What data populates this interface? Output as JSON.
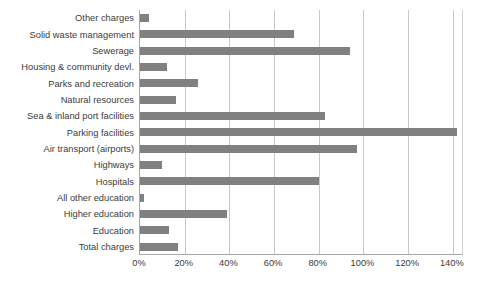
{
  "chart_data": {
    "type": "bar",
    "orientation": "horizontal",
    "title": "",
    "subtitle": "",
    "xlabel": "",
    "ylabel": "",
    "xlim": [
      0,
      145
    ],
    "xticks": [
      "0%",
      "20%",
      "40%",
      "60%",
      "80%",
      "100%",
      "120%",
      "140%"
    ],
    "xtick_values": [
      0,
      20,
      40,
      60,
      80,
      100,
      120,
      140
    ],
    "grid": "vertical",
    "legend": "none",
    "bar_color": "#808080",
    "gridline_color": "#c8c8c8",
    "axis_color": "#a6a6a6",
    "categories": [
      "Other charges",
      "Solid waste management",
      "Sewerage",
      "Housing & community devl.",
      "Parks and recreation",
      "Natural resources",
      "Sea & inland port facilities",
      "Parking facilities",
      "Air transport (airports)",
      "Highways",
      "Hospitals",
      "All other education",
      "Higher education",
      "Education",
      "Total charges"
    ],
    "values": [
      4,
      69,
      94,
      12,
      26,
      16,
      83,
      142,
      97,
      10,
      80,
      2,
      39,
      13,
      17
    ],
    "series": [
      {
        "name": "Charges as percent",
        "values": [
          4,
          69,
          94,
          12,
          26,
          16,
          83,
          142,
          97,
          10,
          80,
          2,
          39,
          13,
          17
        ]
      }
    ]
  }
}
